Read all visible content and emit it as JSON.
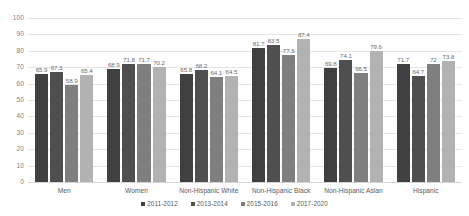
{
  "chart_data": {
    "type": "bar",
    "title": "",
    "subtitle": "",
    "xlabel": "",
    "ylabel": "",
    "ylim": [
      0,
      100
    ],
    "yticks": [
      0,
      10,
      20,
      30,
      40,
      50,
      60,
      70,
      80,
      90,
      100
    ],
    "grid": true,
    "legend_position": "bottom",
    "categories": [
      "Men",
      "Women",
      "Non-Hispanic White",
      "Non-Hispanic Black",
      "Non-Hispanic Asian",
      "Hispanic"
    ],
    "series": [
      {
        "name": "2011-2012",
        "color": "#404040",
        "values": [
          65.9,
          68.9,
          65.8,
          81.7,
          69.8,
          71.7
        ]
      },
      {
        "name": "2013-2014",
        "color": "#4f4f4f",
        "values": [
          67.3,
          71.8,
          68.2,
          83.5,
          74.1,
          64.7
        ]
      },
      {
        "name": "2015-2016",
        "color": "#7f7f7f",
        "values": [
          58.9,
          71.7,
          64.1,
          77.5,
          66.5,
          72
        ]
      },
      {
        "name": "2017-2020",
        "color": "#b2b2b2",
        "values": [
          65.4,
          70.2,
          64.5,
          87.4,
          79.6,
          73.8
        ]
      }
    ],
    "value_labels": [
      [
        "65.9",
        "67.3",
        "58.9",
        "65.4"
      ],
      [
        "68.9",
        "71.8",
        "71.7",
        "70.2"
      ],
      [
        "65.8",
        "68.2",
        "64.1",
        "64.5"
      ],
      [
        "81.7",
        "83.5",
        "77.5",
        "87.4"
      ],
      [
        "69.8",
        "74.1",
        "66.5",
        "79.6"
      ],
      [
        "71.7",
        "64.7",
        "72",
        "73.8"
      ]
    ],
    "ytick_labels": [
      "0",
      "10",
      "20",
      "30",
      "40",
      "50",
      "60",
      "70",
      "80",
      "90",
      "100"
    ]
  }
}
